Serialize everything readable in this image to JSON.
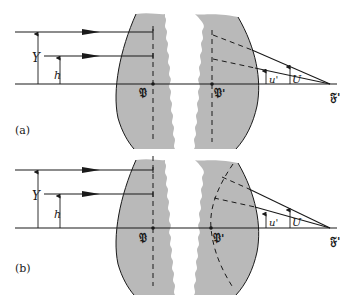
{
  "figure": {
    "panels": [
      {
        "id": "a",
        "panel_label": "(a)",
        "ray_height_outer": "Y",
        "ray_height_inner": "h",
        "principal_point_front": "𝔓",
        "principal_point_rear": "𝔓'",
        "rear_focal_point": "𝔉'",
        "angle_inner": "u'",
        "angle_outer": "U",
        "principal_surface_shape": "plane"
      },
      {
        "id": "b",
        "panel_label": "(b)",
        "ray_height_outer": "Y",
        "ray_height_inner": "h",
        "principal_point_front": "𝔓",
        "principal_point_rear": "𝔓'",
        "rear_focal_point": "𝔉'",
        "angle_inner": "u'",
        "angle_outer": "U",
        "principal_surface_shape": "curved"
      }
    ]
  },
  "colors": {
    "lens_fill": "#b9b9b9",
    "line": "#1a1a1a",
    "background": "#ffffff"
  }
}
